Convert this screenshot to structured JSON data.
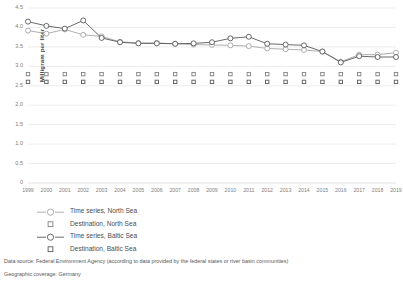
{
  "chart_data": {
    "type": "line",
    "title": "",
    "subtitle": "",
    "xlabel": "",
    "ylabel": "Milligram per liter",
    "ylim": [
      0,
      4.5
    ],
    "ytick_step": 0.5,
    "yticks": [
      "0",
      "0.5",
      "1.0",
      "1.5",
      "2.0",
      "2.5",
      "3.0",
      "3.5",
      "4.0",
      "4.5"
    ],
    "ytick_values": [
      0,
      0.5,
      1.0,
      1.5,
      2.0,
      2.5,
      3.0,
      3.5,
      4.0,
      4.5
    ],
    "grid": "horizontal",
    "legend_position": "below-left",
    "categories": [
      "1999",
      "2000",
      "2001",
      "2002",
      "2003",
      "2004",
      "2005",
      "2006",
      "2007",
      "2008",
      "2009",
      "2010",
      "2011",
      "2012",
      "2013",
      "2014",
      "2015",
      "2016",
      "2017",
      "2018",
      "2019"
    ],
    "x": [
      1999,
      2000,
      2001,
      2002,
      2003,
      2004,
      2005,
      2006,
      2007,
      2008,
      2009,
      2010,
      2011,
      2012,
      2013,
      2014,
      2015,
      2016,
      2017,
      2018,
      2019
    ],
    "series": [
      {
        "name": "Time series, North Sea",
        "style": "line-marker",
        "color": "#a6a6a6",
        "marker": "circle-open",
        "values": [
          3.92,
          3.84,
          3.95,
          3.81,
          3.77,
          3.63,
          3.6,
          3.6,
          3.58,
          3.56,
          3.55,
          3.54,
          3.52,
          3.46,
          3.44,
          3.42,
          3.38,
          3.12,
          3.3,
          3.3,
          3.35
        ]
      },
      {
        "name": "Destination, North Sea",
        "style": "marker-only",
        "color": "#808080",
        "marker": "square-open",
        "values": [
          2.8,
          2.8,
          2.8,
          2.8,
          2.8,
          2.8,
          2.8,
          2.8,
          2.8,
          2.8,
          2.8,
          2.8,
          2.8,
          2.8,
          2.8,
          2.8,
          2.8,
          2.8,
          2.8,
          2.8,
          2.8
        ]
      },
      {
        "name": "Time series, Baltic Sea",
        "style": "line-marker",
        "color": "#595959",
        "marker": "circle-open",
        "values": [
          4.15,
          4.04,
          3.97,
          4.18,
          3.73,
          3.62,
          3.59,
          3.59,
          3.58,
          3.59,
          3.62,
          3.72,
          3.76,
          3.58,
          3.56,
          3.54,
          3.38,
          3.1,
          3.26,
          3.24,
          3.24
        ]
      },
      {
        "name": "Destination, Baltic Sea",
        "style": "marker-only",
        "color": "#595959",
        "marker": "square-open",
        "values": [
          2.6,
          2.6,
          2.6,
          2.6,
          2.6,
          2.6,
          2.6,
          2.6,
          2.6,
          2.6,
          2.6,
          2.6,
          2.6,
          2.6,
          2.6,
          2.6,
          2.6,
          2.6,
          2.6,
          2.6,
          2.6
        ]
      }
    ]
  },
  "legend": {
    "items": [
      {
        "label": "Time series, North Sea"
      },
      {
        "label": "Destination, North Sea"
      },
      {
        "label": "Time series, Baltic Sea"
      },
      {
        "label": "Destination, Baltic Sea"
      }
    ]
  },
  "footnotes": [
    "Data source: Federal Environment Agency (according to data provided by the federal states or river basin communities)",
    "Geographic coverage: Germany"
  ],
  "colors": {
    "north_sea_line": "#a6a6a6",
    "baltic_sea_line": "#595959",
    "grid": "#d9d9d9",
    "axis_text": "#808080",
    "body_text": "#595959"
  }
}
